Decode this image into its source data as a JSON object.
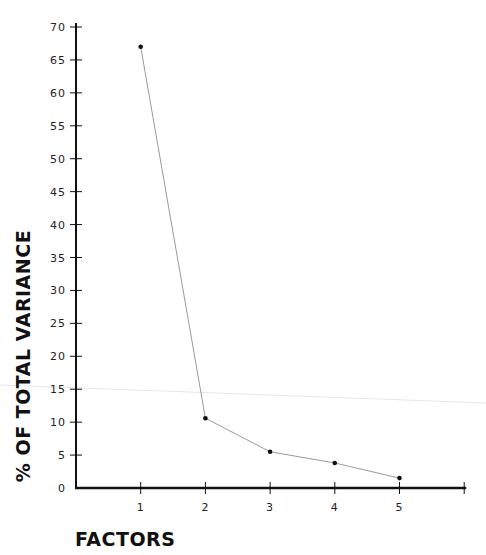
{
  "chart_data": {
    "type": "line",
    "title": "",
    "xlabel": "FACTORS",
    "ylabel": "% OF TOTAL VARIANCE",
    "categories": [
      "1",
      "2",
      "3",
      "4",
      "5"
    ],
    "x": [
      1,
      2,
      3,
      4,
      5
    ],
    "values": [
      67,
      10.6,
      5.5,
      3.8,
      1.5
    ],
    "series": [
      {
        "name": "% of total variance",
        "values": [
          67,
          10.6,
          5.5,
          3.8,
          1.5
        ]
      }
    ],
    "ylim": [
      0,
      70
    ],
    "xlim": [
      0,
      6
    ],
    "y_ticks": [
      0,
      5,
      10,
      15,
      20,
      25,
      30,
      35,
      40,
      45,
      50,
      55,
      60,
      65,
      70
    ],
    "x_ticks": [
      1,
      2,
      3,
      4,
      5,
      6
    ],
    "x_tick_labels": [
      "1",
      "2",
      "3",
      "4",
      "5",
      ""
    ],
    "grid": false,
    "legend": "none",
    "colors": {
      "axis": "#111111",
      "line": "#9a9a9a",
      "marker": "#111111",
      "text": "#222222"
    }
  }
}
